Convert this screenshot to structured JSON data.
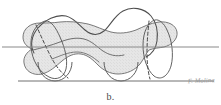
{
  "figure": {
    "caption": "b.",
    "signature": "F. Molina",
    "background_color": "#ffffff",
    "ink_color": "#5a5a5a",
    "dark_ink_color": "#3f3f3f",
    "shading_fill_color": "#e4e4e4",
    "shading_edge_color": "#707070",
    "rule_line_color": "#8a8a8a",
    "elements": {
      "shaded_solid_label": "shaded blob cross-section",
      "outline_curve_label": "upper free-form contour",
      "hidden_edge_label": "dashed hidden edge",
      "cutting_plane_line_label": "horizontal cutting plane line",
      "baseline_label": "baseline rule",
      "left_arc_label": "left lower semicircular arc",
      "right_arc_label": "right lower semicircular arc",
      "left_ellipse_label": "left end ellipse",
      "right_ellipse_label": "right end ellipse"
    },
    "geometry": {
      "cutting_plane_y": 47,
      "baseline_y": 81,
      "cutting_plane_x_start": 2,
      "cutting_plane_x_end": 219,
      "baseline_x_start": 18,
      "baseline_x_end": 214
    }
  }
}
